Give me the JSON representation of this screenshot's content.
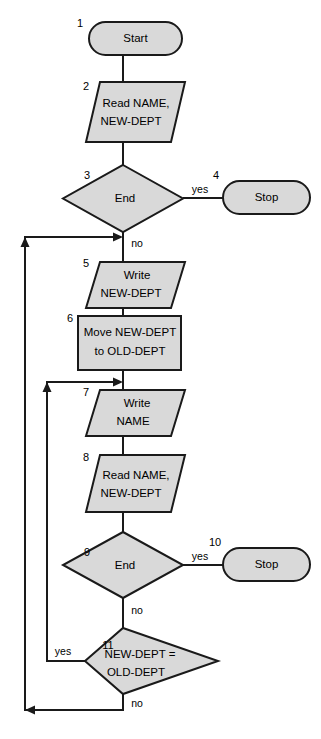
{
  "diagram": {
    "type": "flowchart",
    "colors": {
      "shape_fill": "#d9d9d9",
      "shape_stroke": "#1a1a1a",
      "connector": "#1a1a1a",
      "background": "#ffffff",
      "text": "#000000"
    },
    "nodes": [
      {
        "id": "n1",
        "number": "1",
        "shape": "terminal",
        "lines": [
          "Start"
        ],
        "text": "Start"
      },
      {
        "id": "n2",
        "number": "2",
        "shape": "parallelogram",
        "lines": [
          "Read NAME,",
          "NEW-DEPT"
        ],
        "text": "Read NAME, NEW-DEPT"
      },
      {
        "id": "n3",
        "number": "3",
        "shape": "diamond",
        "lines": [
          "End"
        ],
        "text": "End"
      },
      {
        "id": "n4",
        "number": "4",
        "shape": "terminal",
        "lines": [
          "Stop"
        ],
        "text": "Stop"
      },
      {
        "id": "n5",
        "number": "5",
        "shape": "parallelogram",
        "lines": [
          "Write",
          "NEW-DEPT"
        ],
        "text": "Write NEW-DEPT"
      },
      {
        "id": "n6",
        "number": "6",
        "shape": "rectangle",
        "lines": [
          "Move NEW-DEPT",
          "to OLD-DEPT"
        ],
        "text": "Move NEW-DEPT to OLD-DEPT"
      },
      {
        "id": "n7",
        "number": "7",
        "shape": "parallelogram",
        "lines": [
          "Write",
          "NAME"
        ],
        "text": "Write NAME"
      },
      {
        "id": "n8",
        "number": "8",
        "shape": "parallelogram",
        "lines": [
          "Read NAME,",
          "NEW-DEPT"
        ],
        "text": "Read NAME, NEW-DEPT"
      },
      {
        "id": "n9",
        "number": "9",
        "shape": "diamond",
        "lines": [
          "End"
        ],
        "text": "End"
      },
      {
        "id": "n10",
        "number": "10",
        "shape": "terminal",
        "lines": [
          "Stop"
        ],
        "text": "Stop"
      },
      {
        "id": "n11",
        "number": "11",
        "shape": "diamond",
        "lines": [
          "NEW-DEPT =",
          "OLD-DEPT"
        ],
        "text": "NEW-DEPT = OLD-DEPT"
      }
    ],
    "branch_labels": {
      "d3_yes": "yes",
      "d3_no": "no",
      "d9_yes": "yes",
      "d9_no": "no",
      "d11_yes": "yes",
      "d11_no": "no"
    },
    "edges": [
      {
        "from": "n1",
        "to": "n2",
        "label": ""
      },
      {
        "from": "n2",
        "to": "n3",
        "label": ""
      },
      {
        "from": "n3",
        "to": "n4",
        "label": "yes"
      },
      {
        "from": "n3",
        "to": "n5",
        "label": "no"
      },
      {
        "from": "n5",
        "to": "n6",
        "label": ""
      },
      {
        "from": "n6",
        "to": "n7",
        "label": ""
      },
      {
        "from": "n7",
        "to": "n8",
        "label": ""
      },
      {
        "from": "n8",
        "to": "n9",
        "label": ""
      },
      {
        "from": "n9",
        "to": "n10",
        "label": "yes"
      },
      {
        "from": "n9",
        "to": "n11",
        "label": "no"
      },
      {
        "from": "n11",
        "to": "n7",
        "label": "yes"
      },
      {
        "from": "n11",
        "to": "n5",
        "label": "no"
      }
    ]
  }
}
